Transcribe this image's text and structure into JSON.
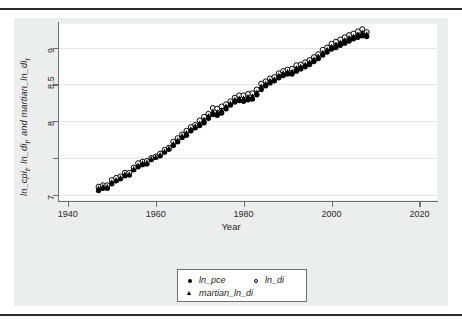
{
  "chart_data": {
    "type": "scatter",
    "title": "",
    "xlabel": "Year",
    "ylabel": "ln_cpi_t, ln_di_t, and martian_ln_di_t",
    "ylabel_html": "ln_cpi<sub>t</sub>, ln_di<sub>t</sub>, and martian_ln_di<sub>t</sub>",
    "xlim": [
      1938,
      2024
    ],
    "ylim": [
      6.93,
      9.32
    ],
    "xticks": [
      1940,
      1960,
      1980,
      2000,
      2020
    ],
    "xticklabels": [
      "1940",
      "1960",
      "1980",
      "2000",
      "2020"
    ],
    "yticks": [
      7,
      7.5,
      8,
      8.5,
      9
    ],
    "yticklabels": [
      "7",
      "",
      "8",
      "8.5",
      "9"
    ],
    "grid": "horizontal",
    "legend_position": "bottom-center",
    "x": [
      1947,
      1948,
      1949,
      1950,
      1951,
      1952,
      1953,
      1954,
      1955,
      1956,
      1957,
      1958,
      1959,
      1960,
      1961,
      1962,
      1963,
      1964,
      1965,
      1966,
      1967,
      1968,
      1969,
      1970,
      1971,
      1972,
      1973,
      1974,
      1975,
      1976,
      1977,
      1978,
      1979,
      1980,
      1981,
      1982,
      1983,
      1984,
      1985,
      1986,
      1987,
      1988,
      1989,
      1990,
      1991,
      1992,
      1993,
      1994,
      1995,
      1996,
      1997,
      1998,
      1999,
      2000,
      2001,
      2002,
      2003,
      2004,
      2005,
      2006,
      2007,
      2008
    ],
    "series": [
      {
        "name": "ln_pce",
        "marker": "filled-circle",
        "color": "#000000",
        "values": [
          7.06,
          7.09,
          7.09,
          7.15,
          7.19,
          7.22,
          7.26,
          7.27,
          7.34,
          7.38,
          7.41,
          7.42,
          7.48,
          7.51,
          7.53,
          7.58,
          7.62,
          7.67,
          7.72,
          7.78,
          7.81,
          7.87,
          7.91,
          7.94,
          7.98,
          8.04,
          8.09,
          8.08,
          8.11,
          8.17,
          8.22,
          8.26,
          8.28,
          8.27,
          8.29,
          8.3,
          8.36,
          8.43,
          8.48,
          8.52,
          8.55,
          8.59,
          8.62,
          8.64,
          8.64,
          8.68,
          8.71,
          8.74,
          8.77,
          8.81,
          8.85,
          8.9,
          8.94,
          8.98,
          9.0,
          9.03,
          9.06,
          9.09,
          9.12,
          9.14,
          9.16,
          9.15
        ]
      },
      {
        "name": "ln_di",
        "marker": "open-circle",
        "color": "#000000",
        "values": [
          7.11,
          7.13,
          7.13,
          7.2,
          7.23,
          7.25,
          7.3,
          7.3,
          7.37,
          7.43,
          7.45,
          7.46,
          7.5,
          7.52,
          7.56,
          7.61,
          7.64,
          7.72,
          7.77,
          7.82,
          7.87,
          7.92,
          7.95,
          8.01,
          8.06,
          8.1,
          8.18,
          8.17,
          8.2,
          8.23,
          8.27,
          8.32,
          8.35,
          8.35,
          8.37,
          8.38,
          8.43,
          8.51,
          8.54,
          8.58,
          8.6,
          8.65,
          8.68,
          8.7,
          8.71,
          8.76,
          8.77,
          8.8,
          8.83,
          8.87,
          8.91,
          8.97,
          9.0,
          9.05,
          9.08,
          9.11,
          9.14,
          9.17,
          9.19,
          9.22,
          9.25,
          9.21
        ]
      },
      {
        "name": "martian_ln_di",
        "marker": "filled-triangle",
        "color": "#000000",
        "values": [
          7.09,
          7.11,
          7.11,
          7.17,
          7.2,
          7.23,
          7.28,
          7.28,
          7.35,
          7.4,
          7.43,
          7.44,
          7.49,
          7.51,
          7.54,
          7.59,
          7.63,
          7.69,
          7.74,
          7.8,
          7.84,
          7.89,
          7.93,
          7.97,
          8.02,
          8.07,
          8.13,
          8.12,
          8.15,
          8.2,
          8.24,
          8.29,
          8.31,
          8.31,
          8.33,
          8.34,
          8.39,
          8.47,
          8.51,
          8.55,
          8.57,
          8.62,
          8.65,
          8.67,
          8.67,
          8.72,
          8.74,
          8.77,
          8.8,
          8.84,
          8.88,
          8.93,
          8.97,
          9.01,
          9.04,
          9.07,
          9.1,
          9.13,
          9.15,
          9.18,
          9.2,
          9.18
        ]
      }
    ]
  },
  "legend": {
    "entries": [
      {
        "label": "ln_pce",
        "marker": "filled-circle"
      },
      {
        "label": "ln_di",
        "marker": "open-circle"
      },
      {
        "label": "martian_ln_di",
        "marker": "filled-triangle"
      }
    ]
  }
}
